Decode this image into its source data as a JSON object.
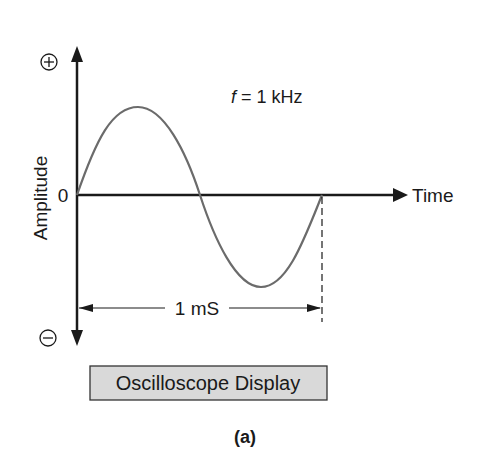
{
  "diagram": {
    "y_axis": {
      "label": "Amplitude",
      "positive_symbol": "+",
      "negative_symbol": "−",
      "origin_label": "0"
    },
    "x_axis": {
      "label": "Time"
    },
    "frequency_label": {
      "var": "f",
      "text": " = 1 kHz"
    },
    "period_label": "1 mS",
    "caption_box": "Oscilloscope Display",
    "sublabel": "(a)",
    "waveform": {
      "type": "sine",
      "cycles": 1,
      "frequency": "1 kHz",
      "period": "1 mS"
    },
    "colors": {
      "axis": "#1a1a1a",
      "wave": "#6b6b6b",
      "box_fill": "#d9d9d9",
      "box_border": "#333333"
    }
  }
}
